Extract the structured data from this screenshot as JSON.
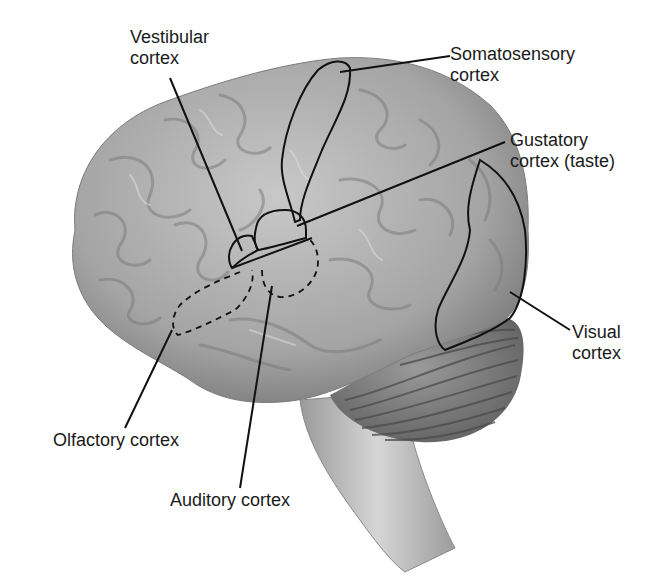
{
  "diagram": {
    "colors": {
      "brain_fill": "#a8a8a8",
      "brain_light": "#d2d2d2",
      "brain_dark": "#6e6e6e",
      "cerebellum": "#8a8a8a",
      "leader_line": "#111111",
      "text": "#1a1a1a",
      "background": "#ffffff"
    },
    "labels": {
      "vestibular": {
        "line1": "Vestibular",
        "line2": "cortex"
      },
      "somatosensory": {
        "line1": "Somatosensory",
        "line2": "cortex"
      },
      "gustatory": {
        "line1": "Gustatory",
        "line2": "cortex (taste)"
      },
      "visual": {
        "line1": "Visual",
        "line2": "cortex"
      },
      "olfactory": {
        "line1": "Olfactory cortex"
      },
      "auditory": {
        "line1": "Auditory cortex"
      }
    },
    "structures": [
      "cerebrum",
      "cerebellum",
      "brainstem"
    ],
    "region_outlines": {
      "solid": [
        "somatosensory",
        "gustatory",
        "vestibular",
        "visual"
      ],
      "dashed": [
        "olfactory",
        "auditory"
      ]
    }
  }
}
